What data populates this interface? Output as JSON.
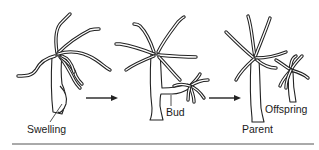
{
  "figure": {
    "stages": [
      {
        "id": "stage-1",
        "label": "Swelling"
      },
      {
        "id": "stage-2",
        "label": "Bud"
      },
      {
        "id": "stage-3",
        "labels": [
          "Parent",
          "Offspring"
        ]
      }
    ],
    "arrows": [
      {
        "from": "stage-1",
        "to": "stage-2"
      },
      {
        "from": "stage-2",
        "to": "stage-3"
      }
    ]
  },
  "labels": {
    "swelling": "Swelling",
    "bud": "Bud",
    "parent": "Parent",
    "offspring": "Offspring"
  },
  "colors": {
    "ink": "#222222",
    "background": "#ffffff",
    "rule": "#555555"
  }
}
